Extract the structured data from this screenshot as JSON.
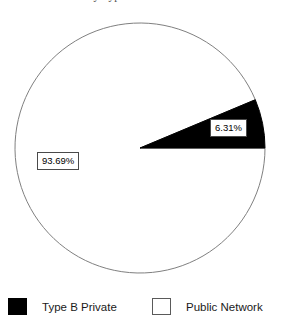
{
  "title": "Market Share by Type B Private vs Public Network",
  "chart_data": {
    "type": "pie",
    "title": "Market Share by Type B Private vs Public Network",
    "xlabel": "",
    "ylabel": "",
    "grid": false,
    "legend_position": "bottom",
    "categories": [
      "Type B Private",
      "Public Network"
    ],
    "values": [
      6.31,
      93.69
    ],
    "value_labels": [
      "6.31%",
      "93.69%"
    ],
    "colors": [
      "#000000",
      "#ffffff"
    ],
    "units": "percent",
    "start_angle_deg": 0,
    "direction": "counterclockwise",
    "slices": [
      {
        "name": "Type B Private",
        "value": 6.31,
        "label": "6.31%",
        "color": "#000000",
        "stroke": "#000000"
      },
      {
        "name": "Public Network",
        "value": 93.69,
        "label": "93.69%",
        "color": "#ffffff",
        "stroke": "#808080"
      }
    ]
  },
  "geometry": {
    "center_x": 140,
    "center_y": 148,
    "radius": 125
  },
  "legend": {
    "items": [
      {
        "label": "Type B Private",
        "swatch": "filled"
      },
      {
        "label": "Public Network",
        "swatch": "hollow"
      }
    ]
  }
}
